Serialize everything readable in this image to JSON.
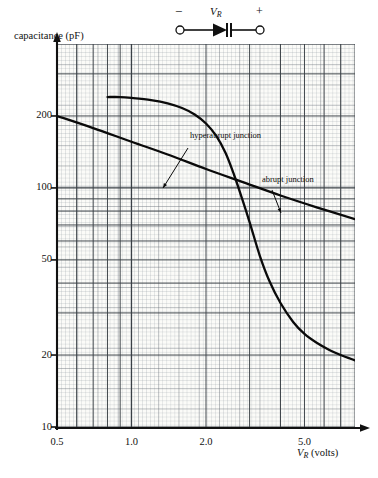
{
  "circuit": {
    "minus_label": "−",
    "plus_label": "+",
    "voltage_label": "V",
    "voltage_sub": "R",
    "symbol": "varactor-diode"
  },
  "axes": {
    "y_title": "capacitance (pF)",
    "x_title_symbol": "V",
    "x_title_sub": "R",
    "x_title_units": "(volts)"
  },
  "chart_data": {
    "type": "line",
    "title": "",
    "subtitle": "",
    "xlabel": "V_R (volts)",
    "ylabel": "capacitance (pF)",
    "xscale": "log",
    "yscale": "log",
    "xlim": [
      0.5,
      8.0
    ],
    "ylim": [
      10,
      400
    ],
    "xticks": [
      0.5,
      1.0,
      2.0,
      5.0
    ],
    "xticklabels": [
      "0.5",
      "1.0",
      "2.0",
      "5.0"
    ],
    "yticks": [
      10,
      20,
      50,
      100,
      200
    ],
    "yticklabels": [
      "10",
      "20",
      "50",
      "100",
      "200"
    ],
    "grid": "log-log graph paper, minor decade grid",
    "legend": "inline annotations",
    "annotations": [
      {
        "text": "hyperabrupt junction",
        "x": 2.05,
        "y": 175
      },
      {
        "text": "abrupt junction",
        "x": 3.6,
        "y": 128
      }
    ],
    "series": [
      {
        "name": "hyperabrupt junction",
        "x": [
          0.8,
          0.9,
          1.0,
          1.2,
          1.4,
          1.6,
          1.8,
          2.0,
          2.2,
          2.4,
          2.6,
          2.8,
          3.0,
          3.3,
          3.6,
          4.0,
          4.5,
          5.0,
          5.6,
          6.3,
          7.0,
          8.0
        ],
        "y": [
          240,
          240,
          238,
          233,
          226,
          216,
          203,
          186,
          165,
          140,
          113,
          90,
          72,
          52,
          41,
          33,
          27.5,
          24.5,
          22.5,
          21,
          20,
          19
        ]
      },
      {
        "name": "abrupt junction",
        "x": [
          0.5,
          0.7,
          1.0,
          1.4,
          2.0,
          2.8,
          4.0,
          5.6,
          8.0
        ],
        "y": [
          200,
          178,
          156,
          138,
          120,
          106,
          93,
          83,
          74
        ]
      }
    ]
  },
  "curves": {
    "hyperabrupt_label": "hyperabrupt junction",
    "abrupt_label": "abrupt junction"
  }
}
